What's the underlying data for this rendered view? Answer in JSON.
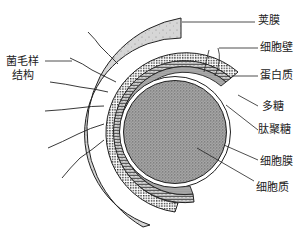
{
  "diagram": {
    "type": "bacterial cell envelope cross-section",
    "colors": {
      "capsule_fill": "#d6d6d6",
      "cytoplasm_fill": "#9c9c9c",
      "outline": "#222222",
      "background": "#ffffff"
    },
    "labels": {
      "capsule": "荚膜",
      "cell_wall": "细胞壁",
      "protein": "蛋白质",
      "polysaccharide": "多糖",
      "peptidoglycan": "肽聚糖",
      "cell_membrane": "细胞膜",
      "cytoplasm": "细胞质",
      "pili_line1": "菌毛样",
      "pili_line2": "结构"
    }
  }
}
